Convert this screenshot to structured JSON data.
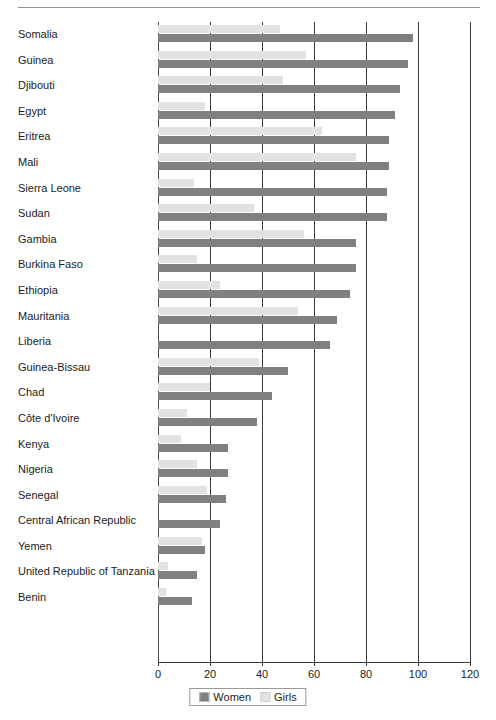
{
  "chart_data": {
    "type": "bar",
    "orientation": "horizontal",
    "title": "",
    "subtitle": "",
    "xlabel": "",
    "ylabel": "",
    "xlim": [
      0,
      120
    ],
    "xticks": [
      0,
      20,
      40,
      60,
      80,
      100,
      120
    ],
    "xticklabels": [
      "0",
      "20",
      "40",
      "60",
      "80",
      "100",
      "120"
    ],
    "grid": true,
    "grid_axis": "x",
    "legend": {
      "position": "bottom-center",
      "entries": [
        {
          "name": "Women",
          "color": "#808080"
        },
        {
          "name": "Girls",
          "color": "#e2e2e2"
        }
      ]
    },
    "categories": [
      "Somalia",
      "Guinea",
      "Djibouti",
      "Egypt",
      "Eritrea",
      "Mali",
      "Sierra Leone",
      "Sudan",
      "Gambia",
      "Burkina Faso",
      "Ethiopia",
      "Mauritania",
      "Liberia",
      "Guinea-Bissau",
      "Chad",
      "Côte d'Ivoire",
      "Kenya",
      "Nigeria",
      "Senegal",
      "Central African Republic",
      "Yemen",
      "United Republic of Tanzania",
      "Benin"
    ],
    "series": [
      {
        "name": "Women",
        "color": "#808080",
        "values": [
          98,
          96,
          93,
          91,
          89,
          89,
          88,
          88,
          76,
          76,
          74,
          69,
          66,
          50,
          44,
          38,
          27,
          27,
          26,
          24,
          18,
          15,
          13
        ]
      },
      {
        "name": "Girls",
        "color": "#e2e2e2",
        "values": [
          47,
          57,
          48,
          18,
          63,
          76,
          14,
          37,
          56,
          15,
          24,
          54,
          0,
          39,
          20,
          11,
          9,
          15,
          19,
          0,
          17,
          4,
          3
        ]
      }
    ]
  },
  "axis": {
    "tick_color": "#3a3a3a",
    "grid_color": "#3a3a3a"
  }
}
